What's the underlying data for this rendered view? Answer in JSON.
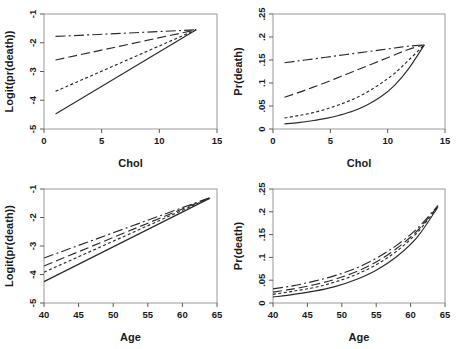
{
  "figure": {
    "title": "",
    "background": "#ffffff",
    "panel_count": 4
  },
  "chart_data": [
    {
      "id": "panel-top-left",
      "type": "line",
      "title": "",
      "xlabel": "Chol",
      "ylabel": "Logit(pr(death))",
      "xlim": [
        0,
        15
      ],
      "ylim": [
        -5,
        -1
      ],
      "xticks": [
        0,
        5,
        10,
        15
      ],
      "xtick_labels": [
        "0",
        "5",
        "10",
        "15"
      ],
      "yticks": [
        -1,
        -2,
        -3,
        -4,
        -5
      ],
      "ytick_labels": [
        "-1",
        "-2",
        "-3",
        "-4",
        "-5"
      ],
      "grid": false,
      "legend": "none",
      "x": [
        1,
        13.2
      ],
      "series": [
        {
          "name": "group-1",
          "style": "dashdot",
          "values": [
            -1.78,
            -1.55
          ]
        },
        {
          "name": "group-2",
          "style": "longdash",
          "values": [
            -2.6,
            -1.55
          ]
        },
        {
          "name": "group-3",
          "style": "shortdash",
          "values": [
            -3.69,
            -1.55
          ]
        },
        {
          "name": "group-4",
          "style": "solid",
          "values": [
            -4.48,
            -1.55
          ]
        }
      ]
    },
    {
      "id": "panel-top-right",
      "type": "line",
      "title": "",
      "xlabel": "Chol",
      "ylabel": "Pr(death)",
      "xlim": [
        0,
        15
      ],
      "ylim": [
        0,
        0.25
      ],
      "xticks": [
        0,
        5,
        10,
        15
      ],
      "xtick_labels": [
        "0",
        "5",
        "10",
        "15"
      ],
      "yticks": [
        0,
        0.05,
        0.1,
        0.15,
        0.2,
        0.25
      ],
      "ytick_labels": [
        "0",
        ".05",
        ".1",
        ".15",
        ".2",
        ".25"
      ],
      "grid": false,
      "legend": "none",
      "x": [
        1,
        2.2,
        3.4,
        4.6,
        5.8,
        7.0,
        8.2,
        9.4,
        10.6,
        11.8,
        13.2
      ],
      "series": [
        {
          "name": "group-1",
          "style": "dashdot",
          "values": [
            0.144,
            0.148,
            0.152,
            0.156,
            0.16,
            0.164,
            0.168,
            0.172,
            0.176,
            0.18,
            0.183
          ]
        },
        {
          "name": "group-2",
          "style": "longdash",
          "values": [
            0.069,
            0.079,
            0.09,
            0.101,
            0.113,
            0.125,
            0.137,
            0.149,
            0.161,
            0.173,
            0.183
          ]
        },
        {
          "name": "group-3",
          "style": "shortdash",
          "values": [
            0.024,
            0.029,
            0.035,
            0.043,
            0.053,
            0.065,
            0.08,
            0.099,
            0.121,
            0.149,
            0.183
          ]
        },
        {
          "name": "group-4",
          "style": "solid",
          "values": [
            0.011,
            0.014,
            0.018,
            0.023,
            0.03,
            0.039,
            0.052,
            0.07,
            0.095,
            0.13,
            0.183
          ]
        }
      ]
    },
    {
      "id": "panel-bottom-left",
      "type": "line",
      "title": "",
      "xlabel": "Age",
      "ylabel": "Logit(pr(death))",
      "xlim": [
        40,
        65
      ],
      "ylim": [
        -5,
        -1
      ],
      "xticks": [
        40,
        45,
        50,
        55,
        60,
        65
      ],
      "xtick_labels": [
        "40",
        "45",
        "50",
        "55",
        "60",
        "65"
      ],
      "yticks": [
        -1,
        -2,
        -3,
        -4,
        -5
      ],
      "ytick_labels": [
        "-1",
        "-2",
        "-3",
        "-4",
        "-5"
      ],
      "grid": false,
      "legend": "none",
      "x": [
        40,
        64
      ],
      "series": [
        {
          "name": "group-1",
          "style": "dashdot",
          "values": [
            -3.42,
            -1.3
          ]
        },
        {
          "name": "group-2",
          "style": "longdash",
          "values": [
            -3.7,
            -1.3
          ]
        },
        {
          "name": "group-3",
          "style": "shortdash",
          "values": [
            -3.92,
            -1.31
          ]
        },
        {
          "name": "group-4",
          "style": "solid",
          "values": [
            -4.25,
            -1.32
          ]
        }
      ]
    },
    {
      "id": "panel-bottom-right",
      "type": "line",
      "title": "",
      "xlabel": "Age",
      "ylabel": "Pr(death)",
      "xlim": [
        40,
        65
      ],
      "ylim": [
        0,
        0.25
      ],
      "xticks": [
        40,
        45,
        50,
        55,
        60,
        65
      ],
      "xtick_labels": [
        "40",
        "45",
        "50",
        "55",
        "60",
        "65"
      ],
      "yticks": [
        0,
        0.05,
        0.1,
        0.15,
        0.2,
        0.25
      ],
      "ytick_labels": [
        "0",
        ".05",
        ".1",
        ".15",
        ".2",
        ".25"
      ],
      "grid": false,
      "legend": "none",
      "x": [
        40,
        43,
        46,
        49,
        52,
        55,
        58,
        61,
        64
      ],
      "series": [
        {
          "name": "group-1",
          "style": "dashdot",
          "values": [
            0.031,
            0.038,
            0.048,
            0.06,
            0.076,
            0.098,
            0.127,
            0.164,
            0.214
          ]
        },
        {
          "name": "group-2",
          "style": "longdash",
          "values": [
            0.024,
            0.031,
            0.04,
            0.052,
            0.068,
            0.09,
            0.12,
            0.159,
            0.213
          ]
        },
        {
          "name": "group-3",
          "style": "shortdash",
          "values": [
            0.019,
            0.026,
            0.034,
            0.046,
            0.062,
            0.084,
            0.114,
            0.155,
            0.212
          ]
        },
        {
          "name": "group-4",
          "style": "solid",
          "values": [
            0.013,
            0.019,
            0.026,
            0.036,
            0.051,
            0.072,
            0.102,
            0.145,
            0.211
          ]
        }
      ]
    }
  ]
}
